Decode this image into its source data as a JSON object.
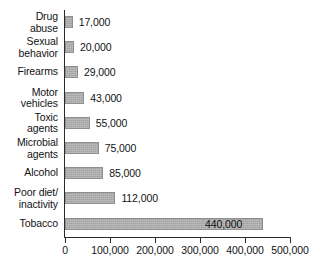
{
  "chart_data": {
    "type": "bar",
    "orientation": "horizontal",
    "title": "",
    "subtitle": "",
    "xlabel": "",
    "ylabel": "",
    "grid": false,
    "legend": null,
    "xlim": [
      0,
      500000
    ],
    "categories": [
      "Drug\nabuse",
      "Sexual\nbehavior",
      "Firearms",
      "Motor\nvehicles",
      "Toxic\nagents",
      "Microbial\nagents",
      "Alcohol",
      "Poor diet/\ninactivity",
      "Tobacco"
    ],
    "values": [
      17000,
      20000,
      29000,
      43000,
      55000,
      75000,
      85000,
      112000,
      440000
    ],
    "value_labels": [
      "17,000",
      "20,000",
      "29,000",
      "43,000",
      "55,000",
      "75,000",
      "85,000",
      "112,000",
      "440,000"
    ],
    "value_label_placement": [
      "outside",
      "outside",
      "outside",
      "outside",
      "outside",
      "outside",
      "outside",
      "outside",
      "inside"
    ],
    "xticks": [
      0,
      100000,
      200000,
      300000,
      400000,
      500000
    ],
    "xtick_labels": [
      "0",
      "100,000",
      "200,000",
      "300,000",
      "400,000",
      "500,000"
    ],
    "bar_color": "#a9a9a9",
    "bar_border_color": "#8f8f8f",
    "axis_color": "#2b2b2b",
    "text_color": "#131313",
    "background_color": "#ffffff"
  }
}
